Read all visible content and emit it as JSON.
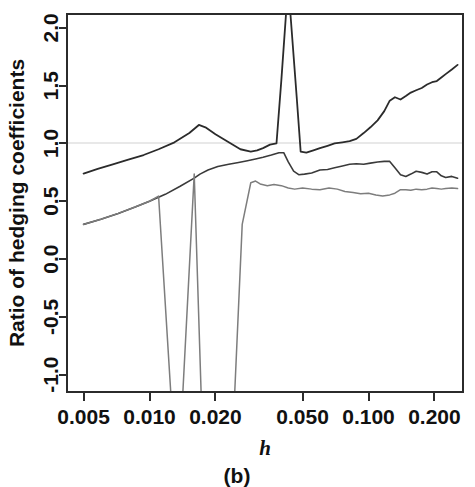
{
  "figure": {
    "panel_caption": "(b)",
    "background_color": "#ffffff",
    "frame_color": "#2b2b2b"
  },
  "chart_data": {
    "type": "line",
    "title": "",
    "subtitle": "",
    "xlabel": "h",
    "ylabel": "Ratio of hedging coefficients",
    "xscale": "log",
    "yscale": "linear",
    "xlim": [
      0.0042,
      0.27
    ],
    "ylim": [
      -1.15,
      2.12
    ],
    "grid": false,
    "reference_line": {
      "y": 1.0,
      "color": "#e8e8e8",
      "label": ""
    },
    "legend": {
      "visible": false,
      "position": "none",
      "entries": []
    },
    "xticks": [
      0.005,
      0.01,
      0.02,
      0.05,
      0.1,
      0.2
    ],
    "xtick_labels": [
      "0.005",
      "0.010",
      "0.020",
      "0.050",
      "0.100",
      "0.200"
    ],
    "yticks": [
      -1.0,
      -0.5,
      0.0,
      0.5,
      1.0,
      1.5,
      2.0
    ],
    "ytick_labels": [
      "-1.0",
      "-0.5",
      "0.0",
      "0.5",
      "1.0",
      "1.5",
      "2.0"
    ],
    "annotations": [
      "Top series spikes above the upper plot limit (2.1) near h = 0.040-0.047",
      "Bottom series drops below the lower plot limit (-1.15) between h = 0.011-0.021 and h = 0.021-0.030"
    ],
    "series": [
      {
        "name": "series-1-upper",
        "color": "#2b2b2b",
        "width": 1.8,
        "x": [
          0.005,
          0.0058,
          0.0068,
          0.008,
          0.0094,
          0.011,
          0.013,
          0.0152,
          0.0168,
          0.018,
          0.02,
          0.023,
          0.026,
          0.029,
          0.031,
          0.033,
          0.0355,
          0.038,
          0.04,
          0.042,
          0.044,
          0.047,
          0.049,
          0.052,
          0.056,
          0.06,
          0.065,
          0.07,
          0.076,
          0.082,
          0.088,
          0.095,
          0.102,
          0.11,
          0.118,
          0.125,
          0.132,
          0.14,
          0.148,
          0.156,
          0.165,
          0.175,
          0.185,
          0.195,
          0.205,
          0.215,
          0.225,
          0.24,
          0.255
        ],
        "y": [
          0.74,
          0.78,
          0.82,
          0.86,
          0.9,
          0.95,
          1.01,
          1.09,
          1.16,
          1.14,
          1.08,
          1.01,
          0.95,
          0.93,
          0.94,
          0.96,
          0.99,
          1.0,
          1.55,
          2.12,
          2.12,
          1.4,
          0.93,
          0.92,
          0.94,
          0.96,
          0.98,
          1.0,
          1.01,
          1.02,
          1.04,
          1.09,
          1.14,
          1.2,
          1.28,
          1.37,
          1.4,
          1.38,
          1.41,
          1.44,
          1.46,
          1.48,
          1.51,
          1.53,
          1.54,
          1.57,
          1.6,
          1.64,
          1.68
        ]
      },
      {
        "name": "series-2-middle",
        "color": "#3a3a3a",
        "width": 1.6,
        "x": [
          0.005,
          0.006,
          0.0072,
          0.0086,
          0.01,
          0.0118,
          0.0138,
          0.016,
          0.017,
          0.0185,
          0.0205,
          0.023,
          0.0255,
          0.028,
          0.0305,
          0.033,
          0.036,
          0.039,
          0.041,
          0.043,
          0.0455,
          0.048,
          0.051,
          0.055,
          0.06,
          0.065,
          0.07,
          0.076,
          0.082,
          0.088,
          0.095,
          0.102,
          0.11,
          0.118,
          0.125,
          0.132,
          0.14,
          0.148,
          0.156,
          0.165,
          0.175,
          0.185,
          0.195,
          0.205,
          0.215,
          0.225,
          0.24,
          0.255
        ],
        "y": [
          0.3,
          0.345,
          0.395,
          0.45,
          0.5,
          0.56,
          0.63,
          0.7,
          0.735,
          0.77,
          0.8,
          0.82,
          0.835,
          0.85,
          0.865,
          0.88,
          0.9,
          0.92,
          0.92,
          0.84,
          0.76,
          0.73,
          0.735,
          0.745,
          0.77,
          0.775,
          0.79,
          0.805,
          0.82,
          0.825,
          0.82,
          0.83,
          0.84,
          0.845,
          0.845,
          0.79,
          0.73,
          0.715,
          0.735,
          0.76,
          0.75,
          0.735,
          0.755,
          0.755,
          0.72,
          0.705,
          0.715,
          0.7
        ]
      },
      {
        "name": "series-3-lower",
        "color": "#7d7d7d",
        "width": 1.5,
        "x": [
          0.005,
          0.006,
          0.0072,
          0.0086,
          0.01,
          0.011,
          0.0125,
          0.0142,
          0.016,
          0.0172,
          0.0185,
          0.0205,
          0.0215,
          0.0245,
          0.0265,
          0.029,
          0.0305,
          0.032,
          0.0345,
          0.037,
          0.04,
          0.043,
          0.046,
          0.05,
          0.055,
          0.06,
          0.066,
          0.072,
          0.078,
          0.085,
          0.092,
          0.1,
          0.108,
          0.116,
          0.125,
          0.132,
          0.14,
          0.148,
          0.156,
          0.165,
          0.175,
          0.185,
          0.195,
          0.205,
          0.215,
          0.225,
          0.24,
          0.255
        ],
        "y": [
          0.3,
          0.345,
          0.395,
          0.45,
          0.5,
          0.545,
          -1.15,
          -1.15,
          0.735,
          -1.15,
          -1.15,
          -1.15,
          -1.15,
          -1.15,
          0.3,
          0.66,
          0.675,
          0.65,
          0.635,
          0.645,
          0.635,
          0.615,
          0.605,
          0.615,
          0.605,
          0.6,
          0.615,
          0.605,
          0.585,
          0.575,
          0.565,
          0.57,
          0.555,
          0.545,
          0.555,
          0.57,
          0.6,
          0.6,
          0.595,
          0.605,
          0.6,
          0.605,
          0.615,
          0.61,
          0.605,
          0.61,
          0.615,
          0.61
        ]
      }
    ]
  },
  "axes_geometry": {
    "plot_left_px": 67,
    "plot_right_px": 463,
    "plot_top_px": 14,
    "plot_bottom_px": 392
  }
}
